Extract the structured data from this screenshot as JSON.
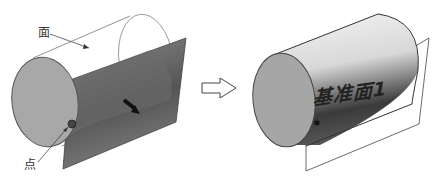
{
  "left_figure": {
    "label_face": "面",
    "label_point": "点"
  },
  "right_figure": {
    "plane_label": "基准面1"
  },
  "colors": {
    "end_cap": "#a8a8a8",
    "plane": "#6e6e6e",
    "outline": "#444444"
  }
}
